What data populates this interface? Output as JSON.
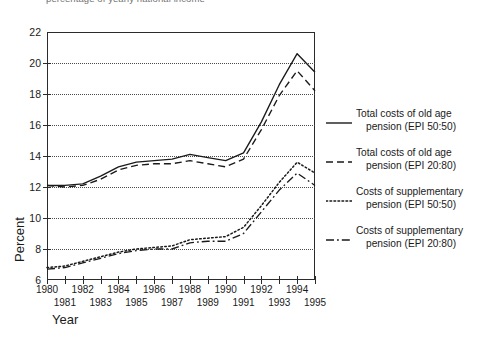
{
  "caption": "percentage of yearly national income",
  "axes": {
    "y_title": "Percent",
    "x_title": "Year",
    "y_ticks": [
      "22",
      "20",
      "18",
      "16",
      "14",
      "12",
      "10",
      "8",
      "6"
    ],
    "x_ticks_row1": [
      "1980",
      "1982",
      "1984",
      "1986",
      "1988",
      "1990",
      "1992",
      "1994"
    ],
    "x_ticks_row2": [
      "1981",
      "1983",
      "1985",
      "1987",
      "1989",
      "1991",
      "1993",
      "1995"
    ]
  },
  "legend": {
    "items": [
      {
        "style": "solid",
        "line1": "Total costs of old age",
        "line2": "pension (EPI 50:50)"
      },
      {
        "style": "dashed",
        "line1": "Total costs of  old age",
        "line2": "pension (EPI 20:80)"
      },
      {
        "style": "dotted",
        "line1": "Costs of supplementary",
        "line2": "pension (EPI 50:50)"
      },
      {
        "style": "dashdot",
        "line1": "Costs of supplementary",
        "line2": "pension (EPI 20:80)"
      }
    ]
  },
  "chart_data": {
    "type": "line",
    "title": "percentage of yearly national income",
    "xlabel": "Year",
    "ylabel": "Percent",
    "xlim": [
      1980,
      1995
    ],
    "ylim": [
      6,
      22
    ],
    "ytick_step": 2,
    "grid": "horizontal-dotted",
    "legend_position": "right",
    "x": [
      1980,
      1981,
      1982,
      1983,
      1984,
      1985,
      1986,
      1987,
      1988,
      1989,
      1990,
      1991,
      1992,
      1993,
      1994,
      1995
    ],
    "series": [
      {
        "name": "Total costs of old age pension (EPI 50:50)",
        "style": "solid",
        "values": [
          12.1,
          12.1,
          12.2,
          12.7,
          13.3,
          13.6,
          13.7,
          13.8,
          14.1,
          13.9,
          13.7,
          14.2,
          16.2,
          18.6,
          20.6,
          19.4
        ]
      },
      {
        "name": "Total costs of old age pension (EPI 20:80)",
        "style": "dashed",
        "values": [
          12.1,
          12.0,
          12.1,
          12.5,
          13.1,
          13.4,
          13.5,
          13.5,
          13.7,
          13.5,
          13.3,
          13.8,
          15.7,
          17.9,
          19.5,
          18.2
        ]
      },
      {
        "name": "Costs of supplementary pension (EPI 50:50)",
        "style": "dotted",
        "values": [
          6.8,
          6.9,
          7.2,
          7.5,
          7.8,
          8.0,
          8.1,
          8.2,
          8.6,
          8.7,
          8.8,
          9.4,
          10.8,
          12.3,
          13.6,
          12.9
        ]
      },
      {
        "name": "Costs of supplementary pension (EPI 20:80)",
        "style": "dashdot",
        "values": [
          6.7,
          6.8,
          7.1,
          7.4,
          7.7,
          7.9,
          8.0,
          8.0,
          8.4,
          8.5,
          8.5,
          9.0,
          10.4,
          11.8,
          12.9,
          12.1
        ]
      }
    ]
  }
}
